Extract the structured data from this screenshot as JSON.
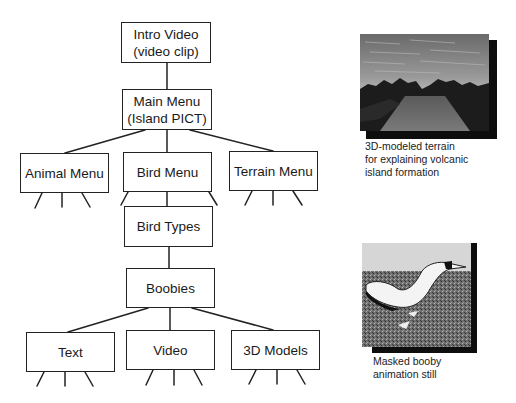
{
  "diagram": {
    "type": "hierarchy",
    "nodes": {
      "intro": {
        "line1": "Intro Video",
        "line2": "(video clip)"
      },
      "main": {
        "line1": "Main Menu",
        "line2": "(Island PICT)"
      },
      "animal": {
        "label": "Animal Menu"
      },
      "bird": {
        "label": "Bird Menu"
      },
      "terrain": {
        "label": "Terrain Menu"
      },
      "bird_types": {
        "label": "Bird Types"
      },
      "boobies": {
        "label": "Boobies"
      },
      "text": {
        "label": "Text"
      },
      "video": {
        "label": "Video"
      },
      "models": {
        "label": "3D Models"
      }
    },
    "edges": [
      [
        "Intro Video",
        "Main Menu"
      ],
      [
        "Main Menu",
        "Animal Menu"
      ],
      [
        "Main Menu",
        "Bird Menu"
      ],
      [
        "Main Menu",
        "Terrain Menu"
      ],
      [
        "Bird Menu",
        "Bird Types"
      ],
      [
        "Bird Types",
        "Boobies"
      ],
      [
        "Boobies",
        "Text"
      ],
      [
        "Boobies",
        "Video"
      ],
      [
        "Boobies",
        "3D Models"
      ]
    ]
  },
  "figures": [
    {
      "image": "3D-modeled-terrain-render",
      "caption_lines": [
        "3D-modeled terrain",
        "for explaining volcanic",
        "island formation"
      ]
    },
    {
      "image": "masked-booby-animation-still",
      "caption_lines": [
        "Masked booby",
        "animation still"
      ]
    }
  ],
  "colors": {
    "line": "#222222",
    "background": "#ffffff",
    "shadow": "#0d0d0d"
  }
}
